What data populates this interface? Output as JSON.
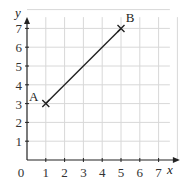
{
  "chart_data": {
    "type": "line",
    "title": "",
    "xlabel": "x",
    "ylabel": "y",
    "xlim": [
      0,
      8
    ],
    "ylim": [
      0,
      8
    ],
    "grid": true,
    "x_ticks": [
      "1",
      "2",
      "3",
      "4",
      "5",
      "6",
      "7"
    ],
    "y_ticks": [
      "1",
      "2",
      "3",
      "4",
      "5",
      "6",
      "7"
    ],
    "origin_label": "0",
    "points": [
      {
        "label": "A",
        "x": 1,
        "y": 3,
        "marker": "x"
      },
      {
        "label": "B",
        "x": 5,
        "y": 7,
        "marker": "x"
      }
    ],
    "segments": [
      {
        "from": "A",
        "to": "B"
      }
    ]
  }
}
